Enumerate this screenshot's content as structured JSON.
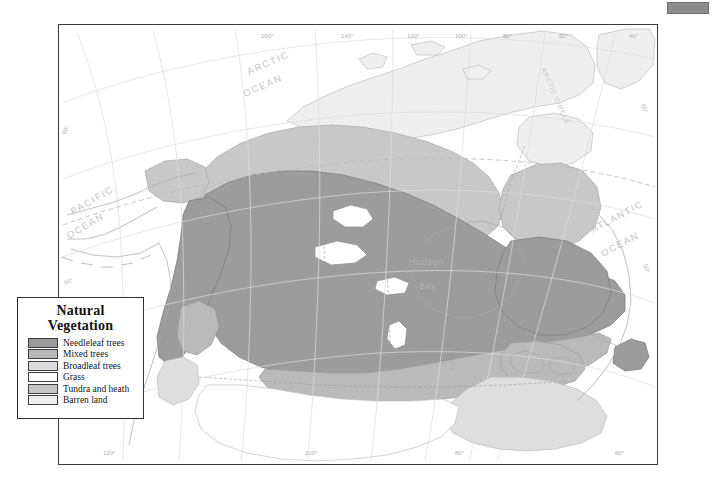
{
  "page": {
    "background_color": "#ffffff",
    "corner_tab_color": "#8b8b8b"
  },
  "legend": {
    "title_line1": "Natural",
    "title_line2": "Vegetation",
    "items": [
      {
        "label": "Needleleaf trees",
        "color": "#9a9a9a"
      },
      {
        "label": "Mixed trees",
        "color": "#b6b6b6"
      },
      {
        "label": "Broadleaf trees",
        "color": "#dcdcdc"
      },
      {
        "label": "Grass",
        "color": "#ffffff"
      },
      {
        "label": "Tundra and heath",
        "color": "#c6c6c6"
      },
      {
        "label": "Barren land",
        "color": "#eeeeee"
      }
    ]
  },
  "map": {
    "ocean_labels": [
      {
        "name": "arctic-ocean",
        "line1": "ARCTIC",
        "line2": "OCEAN"
      },
      {
        "name": "pacific-ocean",
        "line1": "PACIFIC",
        "line2": "OCEAN"
      },
      {
        "name": "atlantic-ocean",
        "line1": "ATLANTIC",
        "line2": "OCEAN"
      }
    ],
    "water_labels": [
      {
        "name": "hudson-bay",
        "line1": "Hudson",
        "line2": "Bay"
      }
    ],
    "reference_lines": [
      {
        "name": "arctic-circle",
        "label": "ARCTIC CIRCLE"
      }
    ],
    "longitude_labels_top": [
      "160°",
      "140°",
      "120°",
      "100°",
      "80°",
      "60°",
      "40°"
    ],
    "longitude_labels_bottom": [
      "120°",
      "100°",
      "80°",
      "60°"
    ],
    "latitude_labels_left": [
      "60°",
      "50°"
    ],
    "latitude_labels_right": [
      "60°",
      "50°"
    ],
    "graticule_color": "#d8d8d8",
    "coastline_color": "#9f9f9f",
    "border_color": "#2e2e2e"
  }
}
